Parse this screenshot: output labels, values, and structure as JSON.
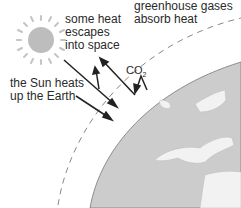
{
  "labels": {
    "escape": "some heat\nescapes\ninto space",
    "sun_heats": "the Sun heats\nup the Earth",
    "greenhouse": "greenhouse gases\nabsorb heat",
    "co2_main": "CO",
    "co2_sub": "2"
  },
  "colors": {
    "sun": "#bdbdbd",
    "rays": "#c4c4c4",
    "earth": "#cccccc",
    "land": "#f2f2f2",
    "atmosphere": "#888888",
    "arrows": "#222222",
    "text": "#2a2a2a"
  }
}
